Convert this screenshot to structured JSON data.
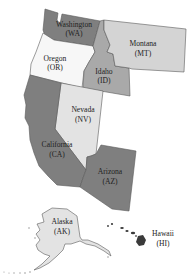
{
  "map": {
    "type": "region map",
    "subject": "Western United States",
    "colors": {
      "dark": "#7f7f7f",
      "medium": "#a9a9a9",
      "light": "#d4d4d4",
      "lighter": "#e3e3e3",
      "white": "#f7f7f7",
      "hawaii": "#3a3a3a",
      "border": "#5a5a5a"
    },
    "states": [
      {
        "name": "Washington",
        "abbr": "(WA)",
        "shade": "dark"
      },
      {
        "name": "Oregon",
        "abbr": "(OR)",
        "shade": "white"
      },
      {
        "name": "Idaho",
        "abbr": "(ID)",
        "shade": "medium"
      },
      {
        "name": "Montana",
        "abbr": "(MT)",
        "shade": "light"
      },
      {
        "name": "Nevada",
        "abbr": "(NV)",
        "shade": "lighter"
      },
      {
        "name": "California",
        "abbr": "(CA)",
        "shade": "dark"
      },
      {
        "name": "Arizona",
        "abbr": "(AZ)",
        "shade": "dark"
      },
      {
        "name": "Alaska",
        "abbr": "(AK)",
        "shade": "lighter"
      },
      {
        "name": "Hawaii",
        "abbr": "(HI)",
        "shade": "hawaii"
      }
    ]
  }
}
